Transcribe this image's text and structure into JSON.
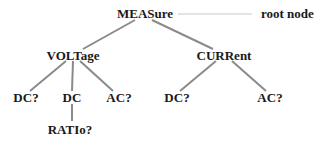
{
  "diagram": {
    "type": "tree",
    "root": {
      "label": "MEASure",
      "annotation": "root node",
      "children": [
        {
          "label": "VOLTage",
          "children": [
            {
              "label": "DC?"
            },
            {
              "label": "DC",
              "children": [
                {
                  "label": "RATIo?"
                }
              ]
            },
            {
              "label": "AC?"
            }
          ]
        },
        {
          "label": "CURRent",
          "children": [
            {
              "label": "DC?"
            },
            {
              "label": "AC?"
            }
          ]
        }
      ]
    },
    "nodes": {
      "measure": "MEASure",
      "voltage": "VOLTage",
      "voltage_dc_query": "DC?",
      "voltage_dc": "DC",
      "ratio_query": "RATIo?",
      "voltage_ac_query": "AC?",
      "current": "CURRent",
      "current_dc_query": "DC?",
      "current_ac_query": "AC?"
    },
    "annotation": "root node",
    "colors": {
      "edge": "#8a8a8a",
      "annotation_leader": "#e4e4e4",
      "text": "#1a1a1a"
    }
  }
}
